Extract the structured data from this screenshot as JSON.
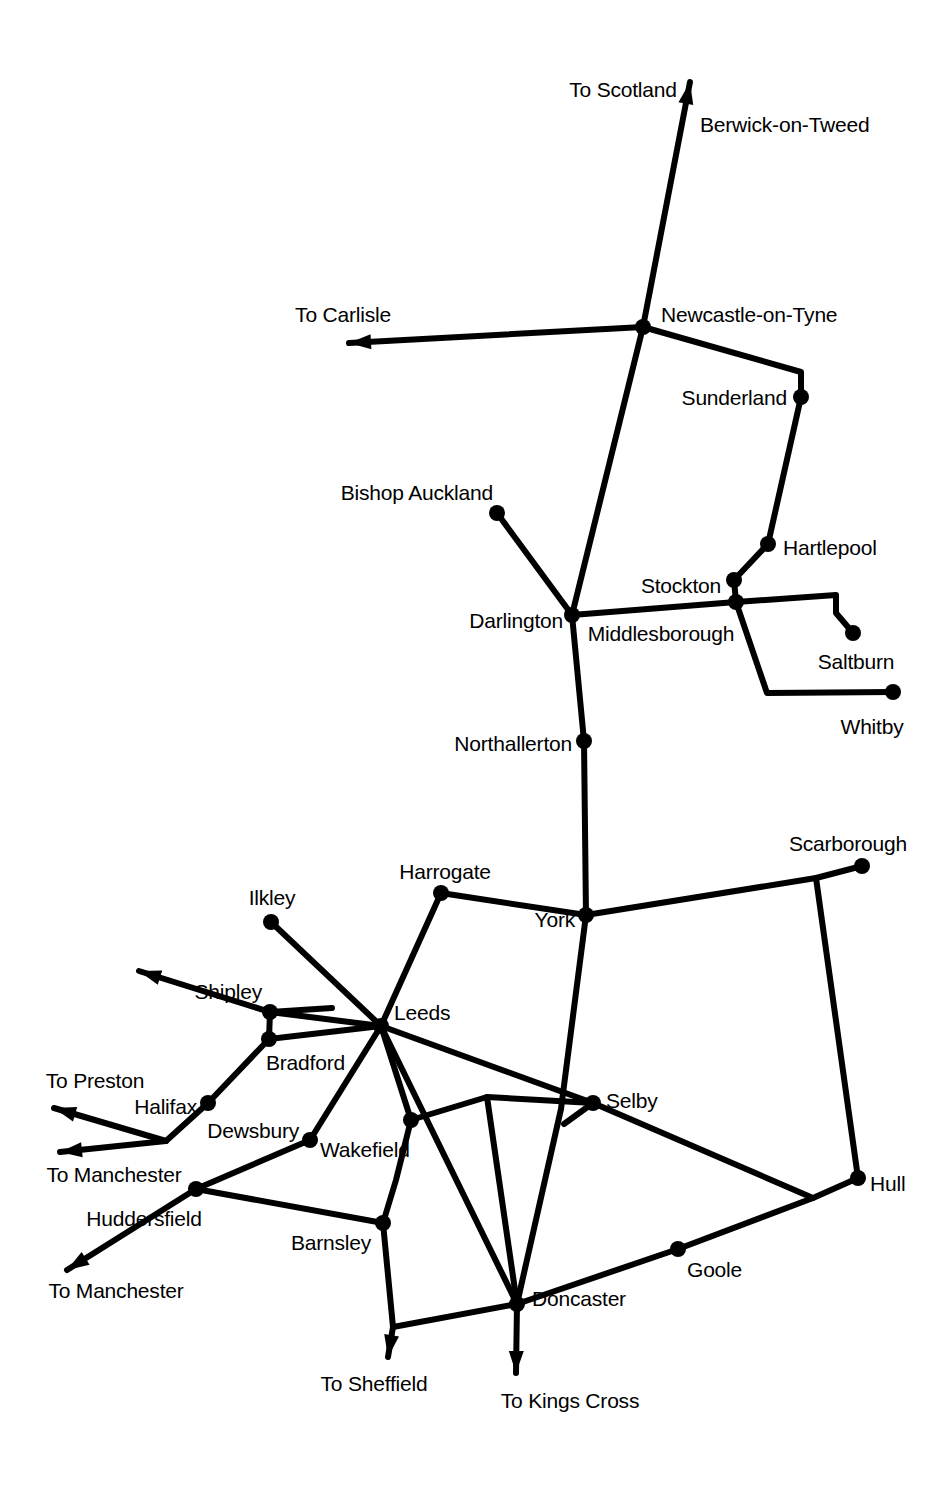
{
  "map": {
    "title": "North East England Railway Network Map",
    "type": "schematic-rail-network",
    "width": 951,
    "height": 1487,
    "background_color": "#ffffff",
    "line_color": "#000000",
    "node_color": "#000000",
    "line_width": 6,
    "node_radius": 8,
    "label_font_size": 21
  },
  "stations": [
    {
      "id": "berwick",
      "label": "Berwick-on-Tweed",
      "x": 690,
      "y": 92,
      "label_x": 700,
      "label_y": 124,
      "anchor": "right",
      "has_node": false
    },
    {
      "id": "newcastle",
      "label": "Newcastle-on-Tyne",
      "x": 643,
      "y": 327,
      "label_x": 661,
      "label_y": 314,
      "anchor": "right",
      "has_node": true
    },
    {
      "id": "sunderland",
      "label": "Sunderland",
      "x": 801,
      "y": 397,
      "label_x": 787,
      "label_y": 397,
      "anchor": "left",
      "has_node": true
    },
    {
      "id": "hartlepool",
      "label": "Hartlepool",
      "x": 768,
      "y": 544,
      "label_x": 783,
      "label_y": 547,
      "anchor": "right",
      "has_node": true
    },
    {
      "id": "stockton",
      "label": "Stockton",
      "x": 734,
      "y": 580,
      "label_x": 721,
      "label_y": 585,
      "anchor": "left",
      "has_node": true
    },
    {
      "id": "middlesborough",
      "label": "Middlesborough",
      "x": 736,
      "y": 602,
      "label_x": 661,
      "label_y": 633,
      "anchor": "center",
      "has_node": true
    },
    {
      "id": "bishop_auckland",
      "label": "Bishop Auckland",
      "x": 497,
      "y": 513,
      "label_x": 493,
      "label_y": 492,
      "anchor": "left",
      "has_node": true
    },
    {
      "id": "darlington",
      "label": "Darlington",
      "x": 572,
      "y": 615,
      "label_x": 563,
      "label_y": 620,
      "anchor": "left",
      "has_node": true
    },
    {
      "id": "saltburn",
      "label": "Saltburn",
      "x": 853,
      "y": 633,
      "label_x": 856,
      "label_y": 661,
      "anchor": "center",
      "has_node": true
    },
    {
      "id": "whitby",
      "label": "Whitby",
      "x": 893,
      "y": 692,
      "label_x": 872,
      "label_y": 726,
      "anchor": "center",
      "has_node": true
    },
    {
      "id": "northallerton",
      "label": "Northallerton",
      "x": 584,
      "y": 741,
      "label_x": 572,
      "label_y": 743,
      "anchor": "left",
      "has_node": true
    },
    {
      "id": "scarborough",
      "label": "Scarborough",
      "x": 862,
      "y": 866,
      "label_x": 848,
      "label_y": 843,
      "anchor": "center",
      "has_node": true
    },
    {
      "id": "harrogate",
      "label": "Harrogate",
      "x": 441,
      "y": 893,
      "label_x": 445,
      "label_y": 871,
      "anchor": "center",
      "has_node": true
    },
    {
      "id": "york",
      "label": "York",
      "x": 586,
      "y": 915,
      "label_x": 575,
      "label_y": 919,
      "anchor": "left",
      "has_node": true
    },
    {
      "id": "ilkley",
      "label": "Ilkley",
      "x": 271,
      "y": 922,
      "label_x": 272,
      "label_y": 897,
      "anchor": "center",
      "has_node": true
    },
    {
      "id": "shipley",
      "label": "Shipley",
      "x": 270,
      "y": 1012,
      "label_x": 262,
      "label_y": 991,
      "anchor": "left",
      "has_node": true
    },
    {
      "id": "leeds",
      "label": "Leeds",
      "x": 381,
      "y": 1026,
      "label_x": 394,
      "label_y": 1012,
      "anchor": "right",
      "has_node": true
    },
    {
      "id": "bradford",
      "label": "Bradford",
      "x": 269,
      "y": 1039,
      "label_x": 266,
      "label_y": 1062,
      "anchor": "right",
      "has_node": true
    },
    {
      "id": "halifax",
      "label": "Halifax",
      "x": 208,
      "y": 1103,
      "label_x": 197,
      "label_y": 1106,
      "anchor": "left",
      "has_node": true
    },
    {
      "id": "selby",
      "label": "Selby",
      "x": 593,
      "y": 1103,
      "label_x": 606,
      "label_y": 1100,
      "anchor": "right",
      "has_node": true
    },
    {
      "id": "wakefield",
      "label": "Wakefield",
      "x": 411,
      "y": 1120,
      "label_x": 320,
      "label_y": 1149,
      "anchor": "right",
      "has_node": true
    },
    {
      "id": "dewsbury",
      "label": "Dewsbury",
      "x": 310,
      "y": 1140,
      "label_x": 299,
      "label_y": 1130,
      "anchor": "left",
      "has_node": true
    },
    {
      "id": "hull",
      "label": "Hull",
      "x": 858,
      "y": 1178,
      "label_x": 870,
      "label_y": 1183,
      "anchor": "right",
      "has_node": true
    },
    {
      "id": "huddersfield",
      "label": "Huddersfield",
      "x": 196,
      "y": 1189,
      "label_x": 144,
      "label_y": 1218,
      "anchor": "center",
      "has_node": true
    },
    {
      "id": "barnsley",
      "label": "Barnsley",
      "x": 383,
      "y": 1223,
      "label_x": 371,
      "label_y": 1242,
      "anchor": "left",
      "has_node": true
    },
    {
      "id": "goole",
      "label": "Goole",
      "x": 678,
      "y": 1249,
      "label_x": 687,
      "label_y": 1269,
      "anchor": "right",
      "has_node": true
    },
    {
      "id": "doncaster",
      "label": "Doncaster",
      "x": 517,
      "y": 1304,
      "label_x": 532,
      "label_y": 1298,
      "anchor": "right",
      "has_node": true
    }
  ],
  "destinations": [
    {
      "id": "to_scotland",
      "label": "To Scotland",
      "label_x": 623,
      "label_y": 89,
      "anchor": "center",
      "tip_x": 690,
      "tip_y": 82
    },
    {
      "id": "to_carlisle",
      "label": "To Carlisle",
      "label_x": 343,
      "label_y": 314,
      "anchor": "center",
      "tip_x": 349,
      "tip_y": 343
    },
    {
      "id": "to_bradford_nw",
      "label": "",
      "label_x": 0,
      "label_y": 0,
      "anchor": "center",
      "tip_x": 139,
      "tip_y": 971
    },
    {
      "id": "to_preston",
      "label": "To Preston",
      "label_x": 95,
      "label_y": 1080,
      "anchor": "center",
      "tip_x": 54,
      "tip_y": 1108
    },
    {
      "id": "to_manchester_1",
      "label": "To Manchester",
      "label_x": 114,
      "label_y": 1174,
      "anchor": "center",
      "tip_x": 60,
      "tip_y": 1152
    },
    {
      "id": "to_manchester_2",
      "label": "To Manchester",
      "label_x": 116,
      "label_y": 1290,
      "anchor": "center",
      "tip_x": 67,
      "tip_y": 1270
    },
    {
      "id": "to_sheffield",
      "label": "To Sheffield",
      "label_x": 374,
      "label_y": 1383,
      "anchor": "center",
      "tip_x": 388,
      "tip_y": 1357
    },
    {
      "id": "to_kings_cross",
      "label": "To Kings Cross",
      "label_x": 570,
      "label_y": 1400,
      "anchor": "center",
      "tip_x": 516,
      "tip_y": 1373
    }
  ],
  "routes": [
    {
      "id": "newcastle-scotland",
      "points": "690,82 643,327",
      "arrow_at_start": true
    },
    {
      "id": "newcastle-carlisle",
      "points": "349,343 643,327",
      "arrow_at_start": true
    },
    {
      "id": "newcastle-sunderland",
      "points": "643,327 801,372 801,397",
      "arrow_at_start": false
    },
    {
      "id": "sunderland-hartlepool",
      "points": "801,397 768,544",
      "arrow_at_start": false
    },
    {
      "id": "hartlepool-stockton",
      "points": "768,544 734,580",
      "arrow_at_start": false
    },
    {
      "id": "stockton-middlesborough",
      "points": "734,580 736,602",
      "arrow_at_start": false
    },
    {
      "id": "newcastle-darlington",
      "points": "643,327 572,615",
      "arrow_at_start": false
    },
    {
      "id": "bishop-darlington",
      "points": "497,513 572,615",
      "arrow_at_start": false
    },
    {
      "id": "darlington-middlesbrough",
      "points": "572,615 736,602",
      "arrow_at_start": false
    },
    {
      "id": "middlesbrough-saltburn",
      "points": "736,602 836,595 836,613 853,633",
      "arrow_at_start": false
    },
    {
      "id": "middlesbrough-whitby",
      "points": "736,602 767,693 893,692",
      "arrow_at_start": false
    },
    {
      "id": "darlington-northallerton",
      "points": "572,615 584,741",
      "arrow_at_start": false
    },
    {
      "id": "northallerton-york",
      "points": "584,741 586,915",
      "arrow_at_start": false
    },
    {
      "id": "harrogate-york",
      "points": "441,893 586,915",
      "arrow_at_start": false
    },
    {
      "id": "york-scarborough",
      "points": "586,915 816,878 862,866",
      "arrow_at_start": false
    },
    {
      "id": "scarboroughjn-hull",
      "points": "816,878 858,1178",
      "arrow_at_start": false
    },
    {
      "id": "harrogate-leeds",
      "points": "441,893 381,1026",
      "arrow_at_start": false
    },
    {
      "id": "ilkley-leeds",
      "points": "271,922 381,1026",
      "arrow_at_start": false
    },
    {
      "id": "shipley-ilkleyline",
      "points": "270,1012 332,1008",
      "arrow_at_start": false
    },
    {
      "id": "shipley-northwest",
      "points": "139,971 270,1012",
      "arrow_at_start": true
    },
    {
      "id": "shipley-leeds",
      "points": "270,1012 381,1026",
      "arrow_at_start": false
    },
    {
      "id": "shipley-bradford",
      "points": "270,1012 269,1039",
      "arrow_at_start": false
    },
    {
      "id": "bradford-leeds",
      "points": "269,1039 381,1026",
      "arrow_at_start": false
    },
    {
      "id": "bradford-halifax",
      "points": "269,1039 208,1103",
      "arrow_at_start": false
    },
    {
      "id": "halifax-preston",
      "points": "54,1108 166,1141 208,1103",
      "arrow_at_start": true
    },
    {
      "id": "halifax-manchester",
      "points": "60,1152 166,1141",
      "arrow_at_start": true
    },
    {
      "id": "leeds-dewsbury",
      "points": "381,1026 310,1140",
      "arrow_at_start": false
    },
    {
      "id": "dewsbury-huddersfield",
      "points": "310,1140 196,1189",
      "arrow_at_start": false
    },
    {
      "id": "huddersfield-manchester",
      "points": "67,1270 196,1189",
      "arrow_at_start": true
    },
    {
      "id": "huddersfield-barnsley",
      "points": "196,1189 383,1223",
      "arrow_at_start": false
    },
    {
      "id": "leeds-wakefield",
      "points": "381,1026 411,1120",
      "arrow_at_start": false
    },
    {
      "id": "wakefield-barnsley",
      "points": "411,1120 396,1180 383,1223",
      "arrow_at_start": false
    },
    {
      "id": "wakefield-selby",
      "points": "411,1120 487,1097 593,1103",
      "arrow_at_start": false
    },
    {
      "id": "wakefieldjn-doncaster",
      "points": "487,1097 517,1304",
      "arrow_at_start": false
    },
    {
      "id": "leeds-selby",
      "points": "381,1026 593,1103",
      "arrow_at_start": false
    },
    {
      "id": "leeds-doncaster",
      "points": "381,1026 517,1304",
      "arrow_at_start": false
    },
    {
      "id": "york-doncaster",
      "points": "586,915 561,1109 517,1304",
      "arrow_at_start": false
    },
    {
      "id": "selby-yorkline",
      "points": "593,1103 564,1124",
      "arrow_at_start": false
    },
    {
      "id": "selby-hull",
      "points": "593,1103 813,1198 858,1178",
      "arrow_at_start": false
    },
    {
      "id": "goole-hull",
      "points": "678,1249 813,1198",
      "arrow_at_start": false
    },
    {
      "id": "doncaster-goole",
      "points": "517,1304 678,1249",
      "arrow_at_start": false
    },
    {
      "id": "barnsley-sheffieldjn",
      "points": "383,1223 393,1327",
      "arrow_at_start": false
    },
    {
      "id": "sheffieldjn-doncaster",
      "points": "393,1327 517,1304",
      "arrow_at_start": false
    },
    {
      "id": "sheffieldjn-sheffield",
      "points": "393,1327 388,1357",
      "arrow_at_start": false,
      "arrow_at_end": true
    },
    {
      "id": "doncaster-kingscross",
      "points": "517,1304 516,1373",
      "arrow_at_start": false,
      "arrow_at_end": true
    }
  ]
}
